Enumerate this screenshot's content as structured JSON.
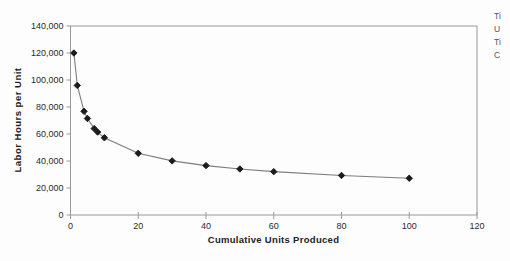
{
  "chart_data": {
    "type": "line",
    "title": "",
    "xlabel": "Cumulative Units Produced",
    "ylabel": "Labor Hours per Unit",
    "x": [
      1,
      2,
      4,
      5,
      7,
      8,
      10,
      20,
      30,
      40,
      50,
      60,
      80,
      100
    ],
    "y": [
      120000,
      96000,
      76800,
      71500,
      64000,
      61440,
      57200,
      45700,
      40100,
      36600,
      34100,
      32100,
      29300,
      27200
    ],
    "xlim": [
      0,
      120
    ],
    "ylim": [
      0,
      140000
    ],
    "xticks": [
      0,
      20,
      40,
      60,
      80,
      100,
      120
    ],
    "yticks": [
      0,
      20000,
      40000,
      60000,
      80000,
      100000,
      120000,
      140000
    ],
    "xtick_labels": [
      "0",
      "20",
      "40",
      "60",
      "80",
      "100",
      "120"
    ],
    "ytick_labels": [
      "0",
      "20,000",
      "40,000",
      "60,000",
      "80,000",
      "100,000",
      "120,000",
      "140,000"
    ],
    "grid": "off",
    "legend": "none",
    "marker": "diamond",
    "line_color": "#7d7d7d",
    "marker_color": "#1c1c1c",
    "axis_color": "#999999",
    "tick_text_color": "#2b2b2b"
  },
  "side_text": {
    "lines": [
      "Ti",
      "U",
      "Ti",
      "C"
    ]
  }
}
